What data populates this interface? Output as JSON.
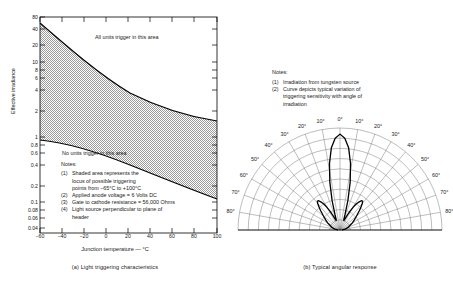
{
  "figure": {
    "panel_a": {
      "caption": "(a)  Light triggering characteristics",
      "ylabel": "Effective irradiance",
      "xlabel": "Junction temperature — °C",
      "annotation_upper": "All units trigger in this area",
      "annotation_lower": "No units trigger in this area",
      "notes_title": "Notes:",
      "notes": [
        {
          "num": "(1)",
          "lines": [
            "Shaded area represents the",
            "locus of possible triggering",
            "points from −65°C to +100°C"
          ]
        },
        {
          "num": "(2)",
          "lines": [
            "Applied anode voltage = 6 Volts DC"
          ]
        },
        {
          "num": "(3)",
          "lines": [
            "Gate to cathode resistance = 56,000 Ohms"
          ]
        },
        {
          "num": "(4)",
          "lines": [
            "Light source perpendicular to plane of",
            "header"
          ]
        }
      ]
    },
    "panel_b": {
      "caption": "(b)  Typical angular response",
      "notes_title": "Notes:",
      "notes": [
        {
          "num": "(1)",
          "lines": [
            "Irradiation from tungsten source"
          ]
        },
        {
          "num": "(2)",
          "lines": [
            "Curve depicts typical variation of",
            "triggering sensitivity with angle of",
            "irradiation"
          ]
        }
      ]
    }
  },
  "chart_data": [
    {
      "type": "area",
      "title": "(a)  Light triggering characteristics",
      "xlabel": "Junction temperature — °C",
      "ylabel": "Effective irradiance",
      "xlim": [
        -70,
        100
      ],
      "ylim": [
        0.035,
        80
      ],
      "yscale": "log",
      "xticks": [
        -60,
        -40,
        -20,
        0,
        20,
        40,
        60,
        80,
        100
      ],
      "xtick_labels": [
        "−60",
        "−40",
        "−20",
        "0",
        "20",
        "40",
        "60",
        "80",
        "100"
      ],
      "yticks": [
        80,
        40,
        20,
        10,
        8,
        6,
        4,
        2,
        1,
        0.8,
        0.6,
        0.4,
        0.2,
        0.1,
        0.08,
        0.06,
        0.04
      ],
      "ytick_labels": [
        "80",
        "40",
        "20",
        "10",
        "8",
        "6",
        "4",
        "2",
        "1",
        "0.8",
        "0.6",
        "0.4",
        "0.2",
        "0.1",
        "0.08",
        "0.06",
        "0.04"
      ],
      "grid": false,
      "shaded_region_label": "Shaded area represents the locus of possible triggering points",
      "series": [
        {
          "name": "Upper limit (all units trigger above)",
          "x": [
            -65,
            -55,
            -45,
            -35,
            -25,
            -15,
            -5,
            5,
            15,
            25,
            35,
            45,
            55,
            65,
            75,
            85,
            95,
            100
          ],
          "values": [
            52,
            44,
            37,
            31,
            26,
            22,
            19,
            16.2,
            14,
            12.2,
            10.8,
            9.6,
            8.6,
            7.8,
            7.1,
            6.6,
            6.2,
            6.0
          ]
        },
        {
          "name": "Lower limit (no units trigger below)",
          "x": [
            -65,
            -55,
            -45,
            -35,
            -25,
            -15,
            -5,
            5,
            15,
            25,
            35,
            45,
            55,
            65,
            75,
            85,
            95,
            100
          ],
          "values": [
            0.88,
            0.87,
            0.86,
            0.84,
            0.81,
            0.78,
            0.73,
            0.67,
            0.6,
            0.53,
            0.46,
            0.39,
            0.33,
            0.275,
            0.225,
            0.185,
            0.152,
            0.14
          ]
        }
      ]
    },
    {
      "type": "line",
      "title": "(b)  Typical angular response",
      "coord": "polar-half",
      "theta_label_unit": "°",
      "theta_labels_left": [
        "10°",
        "20°",
        "30°",
        "40°",
        "50°",
        "60°",
        "70°",
        "80°"
      ],
      "theta_labels_right": [
        "10°",
        "20°",
        "30°",
        "40°",
        "50°",
        "60°",
        "70°",
        "80°"
      ],
      "theta_label_center": "0°",
      "theta_range": [
        -90,
        90
      ],
      "theta_gridlines_every_deg": 10,
      "radial_rings": 10,
      "grid": true,
      "series": [
        {
          "name": "Relative triggering sensitivity",
          "theta": [
            -90,
            -85,
            -80,
            -75,
            -70,
            -65,
            -60,
            -55,
            -50,
            -45,
            -42,
            -40,
            -38,
            -36,
            -34,
            -32,
            -30,
            -28,
            -26,
            -24,
            -22,
            -20,
            -18,
            -15,
            -12,
            -9,
            -6,
            -3,
            0,
            3,
            6,
            9,
            12,
            15,
            18,
            20,
            22,
            24,
            26,
            28,
            30,
            32,
            34,
            36,
            38,
            40,
            42,
            45,
            50,
            55,
            60,
            65,
            70,
            75,
            80,
            85,
            90
          ],
          "r": [
            0.02,
            0.03,
            0.05,
            0.07,
            0.09,
            0.11,
            0.14,
            0.17,
            0.21,
            0.27,
            0.31,
            0.34,
            0.36,
            0.355,
            0.33,
            0.3,
            0.26,
            0.21,
            0.16,
            0.12,
            0.1,
            0.11,
            0.16,
            0.3,
            0.48,
            0.66,
            0.81,
            0.9,
            0.94,
            0.9,
            0.81,
            0.66,
            0.48,
            0.3,
            0.16,
            0.11,
            0.1,
            0.12,
            0.16,
            0.21,
            0.26,
            0.3,
            0.33,
            0.355,
            0.36,
            0.34,
            0.31,
            0.27,
            0.21,
            0.17,
            0.14,
            0.11,
            0.09,
            0.07,
            0.05,
            0.03,
            0.02
          ]
        }
      ]
    }
  ]
}
